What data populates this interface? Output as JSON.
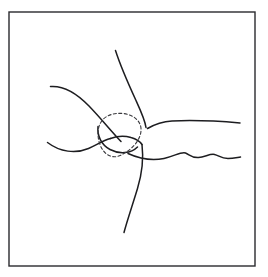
{
  "figure": {
    "canvas": {
      "width": 268,
      "height": 277,
      "background_color": "#ffffff"
    },
    "frame": {
      "name": "border-frame",
      "x": 9,
      "y": 12,
      "width": 246,
      "height": 254,
      "stroke_color": "#2a2a2e",
      "stroke_width": 1.4,
      "fill_color": "#ffffff"
    },
    "ink": {
      "solid_color": "#1d1d20",
      "dashed_color": "#3a3a3e",
      "solid_width": 1.5,
      "dashed_width": 1.1,
      "dash_pattern": "3 2.4"
    },
    "strokes": [
      {
        "name": "upper-vertical-strand",
        "style": "solid",
        "path": "M 115.5 50.5 C 119.5 63 127.5 82 136 100.5 C 141.5 112.5 145 120 146 127.5"
      },
      {
        "name": "upper-left-strand",
        "style": "solid",
        "path": "M 50.5 86.5 C 63 85.5 76 92.5 89 106 C 101 118.5 111 131 121 141.5"
      },
      {
        "name": "lower-left-strand",
        "style": "solid",
        "path": "M 47.5 142.5 C 60 152 75.5 154 88.5 148.5 C 96.5 145 103 140.5 110.5 138.5"
      },
      {
        "name": "upper-right-strand",
        "style": "solid",
        "path": "M 147.5 128.5 C 156 123.5 163 121.5 172 121 C 192 120 217 121 240 123"
      },
      {
        "name": "lower-right-strand",
        "style": "solid",
        "path": "M 128 153.5 C 140 159 152 161 164 158.5 C 175 156 181 151.5 185.5 153 C 189.5 154.5 191.5 158 198.5 157.5 C 205 157 210 153.5 214.5 154.5 C 219 155.5 221 158.5 228 158.5 C 233 158.5 237 157.5 240.5 157"
      },
      {
        "name": "lower-vertical-strand",
        "style": "solid",
        "path": "M 142 144.5 C 143.5 157 142.5 172 137.5 188.5 C 132.5 205 127 221 124 232.5"
      },
      {
        "name": "junction-short-link",
        "style": "solid",
        "path": "M 110.5 138.5 C 117 136 124.5 135.5 131 137.5 C 136.5 139 140 141.5 142 144.5"
      },
      {
        "name": "ellipse-lower-cup",
        "style": "solid",
        "path": "M 98 126.5 C 97 136 101.5 145 110 149.5 C 119.5 154.5 131 153.5 137.5 147"
      },
      {
        "name": "dashed-region-outline",
        "style": "dashed",
        "path": "M 100.5 123 C 104 116 113 112.5 123 113.5 C 133 114.5 140.5 120.5 141 128.5 C 141.5 136 137 143 131.5 148 C 127 152 121.5 155.5 117 156.5 C 112 157.5 107 155.5 103.5 151 C 100 146.5 98 140 98 133.5 C 98 129 99 125.5 100.5 123 Z"
      }
    ]
  }
}
